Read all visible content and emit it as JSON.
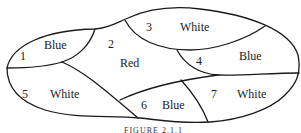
{
  "figure": {
    "caption": "FIGURE 2.1.1",
    "regions": [
      {
        "number": "1",
        "color": "Blue"
      },
      {
        "number": "2",
        "color": "Red"
      },
      {
        "number": "3",
        "color": "White"
      },
      {
        "number": "4",
        "color": "Blue"
      },
      {
        "number": "5",
        "color": "White"
      },
      {
        "number": "6",
        "color": "Blue"
      },
      {
        "number": "7",
        "color": "White"
      }
    ]
  }
}
